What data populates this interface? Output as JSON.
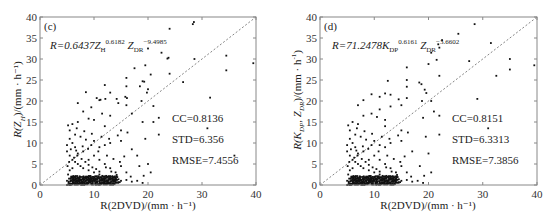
{
  "chart_data": [
    {
      "type": "scatter",
      "panel_tag": "(c)",
      "title": "",
      "formula": {
        "prefix": "R=0.6437Z",
        "sub1": "H",
        "sup1": "0.6182",
        "mid": "Z",
        "sub2": "DR",
        "sup2": "−9.4985"
      },
      "xlabel": "R(2DVD)/(mm · h⁻¹)",
      "ylabel": "R(Z_H)/(mm · h⁻¹)",
      "xlim": [
        0,
        40
      ],
      "ylim": [
        0,
        40
      ],
      "xticks": [
        0,
        10,
        20,
        30,
        40
      ],
      "yticks": [
        0,
        5,
        10,
        15,
        20,
        25,
        30,
        35,
        40
      ],
      "reference_line": "1:1 dashed",
      "stats": {
        "cc": "CC=0.8136",
        "std": "STD=6.356",
        "rmse": "RMSE=7.4556"
      },
      "points": [
        [
          28.5,
          38.8
        ],
        [
          28.3,
          38.3
        ],
        [
          24,
          37.2
        ],
        [
          20,
          32.5
        ],
        [
          22.5,
          31.5
        ],
        [
          23.8,
          30.3
        ],
        [
          23.6,
          30.1
        ],
        [
          28.6,
          30
        ],
        [
          34.5,
          30.8
        ],
        [
          39.5,
          29
        ],
        [
          19.5,
          28.5
        ],
        [
          17.5,
          27.8
        ],
        [
          20.5,
          26.3
        ],
        [
          24,
          26.5
        ],
        [
          34.5,
          27.3
        ],
        [
          16,
          25.5
        ],
        [
          19,
          24.7
        ],
        [
          19.3,
          24.6
        ],
        [
          18.5,
          23.5
        ],
        [
          20,
          22.8
        ],
        [
          19.8,
          22
        ],
        [
          16,
          23.5
        ],
        [
          12,
          23.8
        ],
        [
          13,
          22
        ],
        [
          8.5,
          22.1
        ],
        [
          10.5,
          20.7
        ],
        [
          11.2,
          20.3
        ],
        [
          12.1,
          20.5
        ],
        [
          14.2,
          20.5
        ],
        [
          15.8,
          21
        ],
        [
          16.1,
          20.7
        ],
        [
          18.8,
          20
        ],
        [
          11,
          20.2
        ],
        [
          7,
          19.5
        ],
        [
          31.5,
          20.8
        ],
        [
          26.5,
          24.5
        ],
        [
          21,
          18.8
        ],
        [
          16,
          19
        ],
        [
          14.5,
          19.5
        ],
        [
          9.5,
          18.5
        ],
        [
          8,
          17.5
        ],
        [
          11.5,
          17
        ],
        [
          13,
          16.5
        ],
        [
          9,
          15.8
        ],
        [
          10,
          15.5
        ],
        [
          7,
          15
        ],
        [
          6,
          14.5
        ],
        [
          12,
          14
        ],
        [
          15,
          13
        ],
        [
          19,
          15
        ],
        [
          21,
          15
        ],
        [
          22,
          16
        ],
        [
          17,
          17
        ],
        [
          19.5,
          11
        ],
        [
          22,
          12
        ],
        [
          31,
          13.5
        ],
        [
          36,
          7
        ],
        [
          18,
          7
        ],
        [
          20,
          5
        ],
        [
          20.5,
          3
        ],
        [
          17,
          8.5
        ],
        [
          15,
          10.5
        ],
        [
          13,
          10
        ],
        [
          12,
          9.5
        ],
        [
          11,
          9
        ],
        [
          10,
          10.5
        ],
        [
          9.5,
          9.5
        ],
        [
          8.5,
          10.8
        ],
        [
          7.5,
          11.5
        ],
        [
          6.5,
          12
        ],
        [
          5.5,
          13
        ],
        [
          5.5,
          11
        ],
        [
          6,
          10
        ],
        [
          6.5,
          9
        ],
        [
          5,
          8
        ],
        [
          5.5,
          7
        ],
        [
          6,
          6
        ],
        [
          6.5,
          5.5
        ],
        [
          7,
          5
        ],
        [
          7.5,
          4.5
        ],
        [
          8,
          4
        ],
        [
          9,
          3.5
        ],
        [
          10,
          3
        ],
        [
          11,
          2.5
        ],
        [
          12,
          2
        ],
        [
          13,
          1.8
        ],
        [
          14,
          1.5
        ],
        [
          15,
          1
        ],
        [
          16,
          1.2
        ],
        [
          17,
          0.8
        ],
        [
          18,
          1
        ],
        [
          19,
          0.5
        ],
        [
          12,
          5
        ],
        [
          13,
          4
        ],
        [
          14,
          3
        ],
        [
          15,
          4.5
        ],
        [
          16,
          3
        ],
        [
          11,
          6
        ],
        [
          10,
          7
        ],
        [
          9,
          6
        ],
        [
          8,
          8
        ],
        [
          7,
          7.5
        ],
        [
          6,
          4
        ],
        [
          5.5,
          3.5
        ],
        [
          5.2,
          2.5
        ],
        [
          5.8,
          2
        ],
        [
          6.2,
          1.5
        ],
        [
          6.8,
          1
        ],
        [
          7.2,
          0.8
        ],
        [
          7.8,
          0.5
        ],
        [
          8.2,
          0.3
        ],
        [
          8.8,
          0.6
        ],
        [
          9.2,
          0.9
        ],
        [
          9.8,
          0.4
        ],
        [
          10.5,
          0.7
        ],
        [
          11.2,
          0.2
        ],
        [
          11.8,
          0.5
        ],
        [
          5,
          1
        ],
        [
          5.3,
          0.5
        ],
        [
          5.6,
          0.2
        ],
        [
          6.1,
          0.6
        ],
        [
          6.6,
          0.3
        ],
        [
          7,
          0.1
        ],
        [
          7.4,
          1.2
        ],
        [
          8,
          1.5
        ],
        [
          8.6,
          1.8
        ],
        [
          9.4,
          1.2
        ],
        [
          10.2,
          1.4
        ],
        [
          5.1,
          4.5
        ],
        [
          5.4,
          5.5
        ],
        [
          6.3,
          6.5
        ],
        [
          6.9,
          7
        ],
        [
          7.7,
          6.2
        ],
        [
          8.4,
          5.5
        ],
        [
          9,
          4.8
        ],
        [
          9.7,
          4.2
        ],
        [
          10.4,
          3.8
        ],
        [
          11,
          3.2
        ],
        [
          5.2,
          14.2
        ],
        [
          6.8,
          13.5
        ],
        [
          8.2,
          12.8
        ],
        [
          9.6,
          12.2
        ],
        [
          11.4,
          11.5
        ],
        [
          12.8,
          11
        ],
        [
          14.4,
          11.8
        ],
        [
          16.2,
          12.5
        ],
        [
          5,
          9.5
        ],
        [
          5.7,
          8.5
        ],
        [
          6.7,
          8.2
        ],
        [
          7.9,
          9.2
        ],
        [
          8.9,
          8.6
        ],
        [
          10.8,
          8
        ],
        [
          12.4,
          7
        ],
        [
          13.6,
          6.2
        ],
        [
          14.8,
          5.5
        ],
        [
          15.6,
          6.8
        ],
        [
          18.4,
          4.5
        ],
        [
          19.2,
          2.2
        ],
        [
          16.8,
          2
        ],
        [
          14.2,
          2.4
        ],
        [
          13.2,
          3.2
        ],
        [
          12.2,
          4.2
        ]
      ]
    },
    {
      "type": "scatter",
      "panel_tag": "(d)",
      "title": "",
      "formula": {
        "prefix": "R=71.2478K",
        "sub1": "DP",
        "sup1": "0.6161",
        "mid": "Z",
        "sub2": "DR",
        "sup2": "−3.6602"
      },
      "xlabel": "R(2DVD)/(mm · h⁻¹)",
      "ylabel": "R(K_DP, Z_DR)/(mm · h⁻¹)",
      "xlim": [
        0,
        40
      ],
      "ylim": [
        0,
        40
      ],
      "xticks": [
        0,
        10,
        20,
        30,
        40
      ],
      "yticks": [
        0,
        5,
        10,
        15,
        20,
        25,
        30,
        35,
        40
      ],
      "reference_line": "1:1 dashed",
      "stats": {
        "cc": "CC=0.8151",
        "std": "STD=6.3313",
        "rmse": "RMSE=7.3856"
      },
      "points": [
        [
          28.5,
          38.3
        ],
        [
          25.5,
          36
        ],
        [
          22.5,
          34.5
        ],
        [
          21.8,
          33.5
        ],
        [
          22,
          32.7
        ],
        [
          20.5,
          31.5
        ],
        [
          21.5,
          29.8
        ],
        [
          27.5,
          29.5
        ],
        [
          31.5,
          33.8
        ],
        [
          35,
          30
        ],
        [
          35,
          27.5
        ],
        [
          39.5,
          28.5
        ],
        [
          16,
          28
        ],
        [
          20,
          28.8
        ],
        [
          22,
          26
        ],
        [
          32.5,
          26
        ],
        [
          12.5,
          24.8
        ],
        [
          16,
          25
        ],
        [
          18.3,
          24.4
        ],
        [
          18.7,
          24
        ],
        [
          16,
          23.4
        ],
        [
          19.3,
          22.7
        ],
        [
          19.6,
          21.9
        ],
        [
          9.5,
          21.6
        ],
        [
          11,
          21
        ],
        [
          12,
          21.8
        ],
        [
          13,
          21.5
        ],
        [
          14.5,
          20.4
        ],
        [
          16,
          20.7
        ],
        [
          18.8,
          20
        ],
        [
          20.5,
          20
        ],
        [
          29,
          20.5
        ],
        [
          8,
          20.2
        ],
        [
          7,
          19
        ],
        [
          15,
          19
        ],
        [
          13,
          18.7
        ],
        [
          11,
          18
        ],
        [
          9.5,
          17
        ],
        [
          8,
          16.5
        ],
        [
          10.5,
          16.2
        ],
        [
          12,
          15.5
        ],
        [
          6,
          15
        ],
        [
          7,
          14.5
        ],
        [
          19,
          16
        ],
        [
          21,
          17.5
        ],
        [
          22,
          16.5
        ],
        [
          12,
          14
        ],
        [
          15,
          13
        ],
        [
          19.5,
          11.5
        ],
        [
          22,
          12
        ],
        [
          31,
          13.5
        ],
        [
          20,
          7.5
        ],
        [
          20.5,
          3
        ],
        [
          17,
          8
        ],
        [
          15,
          10.5
        ],
        [
          13,
          10
        ],
        [
          12,
          9
        ],
        [
          11,
          9.5
        ],
        [
          10,
          10.5
        ],
        [
          9.5,
          9.5
        ],
        [
          8.5,
          10.8
        ],
        [
          7.5,
          11.5
        ],
        [
          6.5,
          12
        ],
        [
          5.5,
          13
        ],
        [
          5.5,
          11
        ],
        [
          6,
          10
        ],
        [
          6.5,
          9
        ],
        [
          5,
          8
        ],
        [
          5.5,
          7
        ],
        [
          6,
          6
        ],
        [
          6.5,
          5.5
        ],
        [
          7,
          5
        ],
        [
          7.5,
          4.5
        ],
        [
          8,
          4
        ],
        [
          9,
          3.5
        ],
        [
          10,
          3
        ],
        [
          11,
          2.5
        ],
        [
          12,
          2
        ],
        [
          13,
          1.8
        ],
        [
          14,
          1.5
        ],
        [
          15,
          1
        ],
        [
          16,
          1.2
        ],
        [
          17,
          0.8
        ],
        [
          18,
          1
        ],
        [
          19,
          0.5
        ],
        [
          12,
          5
        ],
        [
          13,
          4
        ],
        [
          14,
          3
        ],
        [
          15,
          4.5
        ],
        [
          16,
          3
        ],
        [
          11,
          6
        ],
        [
          10,
          7
        ],
        [
          9,
          6
        ],
        [
          8,
          8
        ],
        [
          7,
          7.5
        ],
        [
          6,
          4
        ],
        [
          5.5,
          3.5
        ],
        [
          5.2,
          2.5
        ],
        [
          5.8,
          2
        ],
        [
          6.2,
          1.5
        ],
        [
          6.8,
          1
        ],
        [
          7.2,
          0.8
        ],
        [
          7.8,
          0.5
        ],
        [
          8.2,
          0.3
        ],
        [
          8.8,
          0.6
        ],
        [
          9.2,
          0.9
        ],
        [
          9.8,
          0.4
        ],
        [
          10.5,
          0.7
        ],
        [
          11.2,
          0.2
        ],
        [
          11.8,
          0.5
        ],
        [
          5,
          1
        ],
        [
          5.3,
          0.5
        ],
        [
          5.6,
          0.2
        ],
        [
          6.1,
          0.6
        ],
        [
          6.6,
          0.3
        ],
        [
          7,
          0.1
        ],
        [
          7.4,
          1.2
        ],
        [
          8,
          1.5
        ],
        [
          8.6,
          1.8
        ],
        [
          9.4,
          1.2
        ],
        [
          10.2,
          1.4
        ],
        [
          5.1,
          4.5
        ],
        [
          5.4,
          5.5
        ],
        [
          6.3,
          6.5
        ],
        [
          6.9,
          7
        ],
        [
          7.7,
          6.2
        ],
        [
          8.4,
          5.5
        ],
        [
          9,
          4.8
        ],
        [
          9.7,
          4.2
        ],
        [
          10.4,
          3.8
        ],
        [
          11,
          3.2
        ],
        [
          5.2,
          14.2
        ],
        [
          6.8,
          13.5
        ],
        [
          8.2,
          12.8
        ],
        [
          9.6,
          12.2
        ],
        [
          11.4,
          11.5
        ],
        [
          12.8,
          11
        ],
        [
          14.4,
          11.8
        ],
        [
          16.2,
          12.5
        ],
        [
          5,
          9.5
        ],
        [
          5.7,
          8.5
        ],
        [
          6.7,
          8.2
        ],
        [
          7.9,
          9.2
        ],
        [
          8.9,
          8.6
        ],
        [
          10.8,
          8
        ],
        [
          12.4,
          7
        ],
        [
          13.6,
          6.2
        ],
        [
          14.8,
          5.5
        ],
        [
          15.6,
          6.8
        ],
        [
          18.4,
          4.5
        ],
        [
          19.2,
          2.2
        ],
        [
          16.8,
          2
        ],
        [
          14.2,
          2.4
        ],
        [
          13.2,
          3.2
        ],
        [
          12.2,
          4.2
        ]
      ]
    }
  ],
  "panels": [
    {
      "tag": "(c)",
      "ylabel_main": "R(Z",
      "ylabel_sub": "H",
      "ylabel_tail": ")/(mm · h⁻¹)",
      "xlabel": "R(2DVD)/(mm · h⁻¹)",
      "formula_prefix": "R=0.6437Z",
      "formula_sub1": "H",
      "formula_sup1": "0.6182",
      "formula_mid": " Z",
      "formula_sub2": "DR",
      "formula_sup2": "−9.4985",
      "cc": "CC=0.8136",
      "std": "STD=6.356",
      "rmse": "RMSE=7.4556"
    },
    {
      "tag": "(d)",
      "ylabel_main": "R(K",
      "ylabel_sub": "DP",
      "ylabel_tail": ", Z_DR)/(mm · h⁻¹)",
      "xlabel": "R(2DVD)/(mm · h⁻¹)",
      "formula_prefix": "R=71.2478K",
      "formula_sub1": "DP",
      "formula_sup1": "0.6161",
      "formula_mid": " Z",
      "formula_sub2": "DR",
      "formula_sup2": "−3.6602",
      "cc": "CC=0.8151",
      "std": "STD=6.3313",
      "rmse": "RMSE=7.3856"
    }
  ]
}
